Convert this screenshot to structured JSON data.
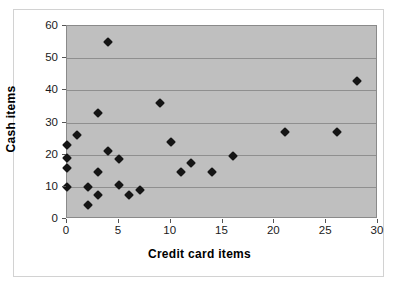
{
  "chart_data": {
    "type": "scatter",
    "title": "",
    "xlabel": "Credit card items",
    "ylabel": "Cash items",
    "xlim": [
      0,
      30
    ],
    "ylim": [
      0,
      60
    ],
    "xticks": [
      0,
      5,
      10,
      15,
      20,
      25,
      30
    ],
    "yticks": [
      0,
      10,
      20,
      30,
      40,
      50,
      60
    ],
    "grid": "horizontal",
    "legend": "none",
    "plot_background": "#bfbfbf",
    "marker": "diamond",
    "marker_color": "#151515",
    "series": [
      {
        "name": "items",
        "points": [
          [
            0,
            23
          ],
          [
            0,
            19
          ],
          [
            0,
            16
          ],
          [
            0,
            10
          ],
          [
            1,
            26
          ],
          [
            2,
            10
          ],
          [
            2,
            4.5
          ],
          [
            3,
            33
          ],
          [
            3,
            14.5
          ],
          [
            3,
            7.5
          ],
          [
            4,
            55
          ],
          [
            4,
            21
          ],
          [
            5,
            18.5
          ],
          [
            5,
            10.5
          ],
          [
            6,
            7.5
          ],
          [
            7,
            9
          ],
          [
            9,
            36
          ],
          [
            10,
            24
          ],
          [
            11,
            14.5
          ],
          [
            12,
            17.5
          ],
          [
            14,
            14.5
          ],
          [
            16,
            19.5
          ],
          [
            21,
            27
          ],
          [
            26,
            27
          ],
          [
            28,
            43
          ]
        ]
      }
    ]
  }
}
